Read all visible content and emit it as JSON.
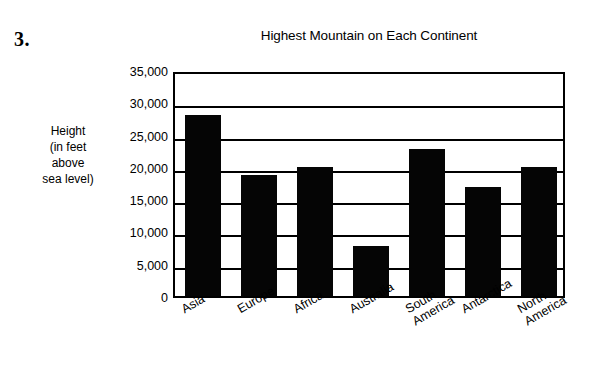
{
  "question_number": "3.",
  "chart_data": {
    "type": "bar",
    "title": "Highest Mountain on Each Continent",
    "xlabel": "",
    "ylabel": "Height (in feet above sea level)",
    "ylabel_lines": [
      "Height",
      "(in feet",
      "above",
      "sea level)"
    ],
    "categories": [
      "Asia",
      "Europe",
      "Africa",
      "Australia",
      "South America",
      "Antarctica",
      "North America"
    ],
    "category_lines": [
      [
        "Asia"
      ],
      [
        "Europe"
      ],
      [
        "Africa"
      ],
      [
        "Australia"
      ],
      [
        "South",
        "America"
      ],
      [
        "Antarctica"
      ],
      [
        "North",
        "America"
      ]
    ],
    "values": [
      28000,
      18700,
      20000,
      7800,
      22800,
      16900,
      20000
    ],
    "ylim": [
      0,
      35000
    ],
    "ytick_values": [
      35000,
      30000,
      25000,
      20000,
      15000,
      10000,
      5000,
      0
    ],
    "ytick_labels": [
      "35,000",
      "30,000",
      "25,000",
      "20,000",
      "15,000",
      "10,000",
      "5,000",
      "0"
    ],
    "grid": true,
    "legend": false,
    "bar_color": "#050505",
    "plot_background": "#ffffff",
    "axis_color": "#000000"
  }
}
